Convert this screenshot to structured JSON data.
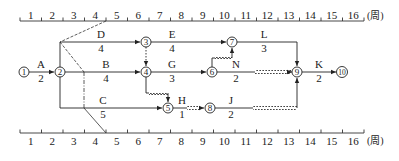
{
  "diagram": {
    "type": "time-scaled network (double-code timescale network plan)",
    "time_unit_label": "(周)",
    "top_scale": {
      "weeks": [
        "1",
        "2",
        "3",
        "4",
        "5",
        "6",
        "7",
        "8",
        "9",
        "10",
        "11",
        "12",
        "13",
        "14",
        "15",
        "16"
      ]
    },
    "bottom_scale": {
      "weeks": [
        "1",
        "2",
        "3",
        "4",
        "5",
        "6",
        "7",
        "8",
        "9",
        "10",
        "11",
        "12",
        "13",
        "14",
        "15",
        "16"
      ]
    },
    "nodes": [
      {
        "id": "1",
        "label": "①"
      },
      {
        "id": "2",
        "label": "②"
      },
      {
        "id": "3",
        "label": "③"
      },
      {
        "id": "4",
        "label": "④"
      },
      {
        "id": "5",
        "label": "⑤"
      },
      {
        "id": "6",
        "label": "⑥"
      },
      {
        "id": "7",
        "label": "⑦"
      },
      {
        "id": "8",
        "label": "⑧"
      },
      {
        "id": "9",
        "label": "⑨"
      },
      {
        "id": "10",
        "label": "⑩"
      }
    ],
    "activities": [
      {
        "name": "A",
        "duration": "2",
        "from": "1",
        "to": "2"
      },
      {
        "name": "B",
        "duration": "4",
        "from": "2",
        "to": "4"
      },
      {
        "name": "C",
        "duration": "5",
        "from": "2",
        "to": "5"
      },
      {
        "name": "D",
        "duration": "4",
        "from": "2",
        "to": "3"
      },
      {
        "name": "E",
        "duration": "4",
        "from": "3",
        "to": "7"
      },
      {
        "name": "G",
        "duration": "3",
        "from": "4",
        "to": "6"
      },
      {
        "name": "H",
        "duration": "1",
        "from": "5",
        "to": "8"
      },
      {
        "name": "J",
        "duration": "2",
        "from": "8",
        "to": "9"
      },
      {
        "name": "L",
        "duration": "3",
        "from": "7",
        "to": "9"
      },
      {
        "name": "N",
        "duration": "2",
        "from": "6",
        "to": "9"
      },
      {
        "name": "K",
        "duration": "2",
        "from": "9",
        "to": "10"
      }
    ],
    "dummy_activities": [
      {
        "from": "3",
        "to": "4"
      },
      {
        "from": "4",
        "to": "5"
      },
      {
        "from": "6",
        "to": "7"
      }
    ],
    "check_line": {
      "style": "dashed",
      "time": "4"
    }
  }
}
